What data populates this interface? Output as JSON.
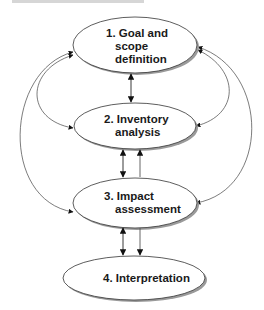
{
  "diagram": {
    "type": "lca-phase-flow",
    "nodes": [
      {
        "id": "goal",
        "lines": [
          "1. Goal and",
          "scope",
          "definition"
        ]
      },
      {
        "id": "inventory",
        "lines": [
          "2. Inventory",
          "analysis"
        ]
      },
      {
        "id": "impact",
        "lines": [
          "3. Impact",
          "assessment"
        ]
      },
      {
        "id": "interpretation",
        "lines": [
          "4. Interpretation"
        ]
      }
    ],
    "edges": [
      {
        "from": "goal",
        "to": "inventory",
        "style": "bidirectional"
      },
      {
        "from": "inventory",
        "to": "impact",
        "style": "bidirectional"
      },
      {
        "from": "impact",
        "to": "inventory",
        "style": "directed"
      },
      {
        "from": "impact",
        "to": "interpretation",
        "style": "bidirectional"
      },
      {
        "from": "impact",
        "to": "interpretation",
        "style": "directed"
      },
      {
        "from": "goal",
        "to": "inventory",
        "style": "curved-bidirectional-left"
      },
      {
        "from": "goal",
        "to": "impact",
        "style": "curved-bidirectional-left"
      },
      {
        "from": "goal",
        "to": "inventory",
        "style": "curved-bidirectional-right"
      },
      {
        "from": "goal",
        "to": "impact",
        "style": "curved-bidirectional-right"
      }
    ],
    "colors": {
      "ellipse_fill": "#ffffff",
      "ellipse_stroke": "#333333",
      "shadow": "#9a9a9a",
      "text": "#1a1a1a",
      "arrow": "#222222"
    }
  }
}
